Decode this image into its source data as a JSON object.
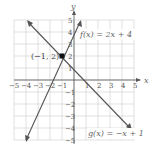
{
  "chart_data": {
    "type": "line",
    "title": "",
    "xlabel": "x",
    "ylabel": "y",
    "xlim": [
      -5,
      5
    ],
    "ylim": [
      -5,
      5
    ],
    "grid": true,
    "x_ticks": [
      "−5",
      "−4",
      "−3",
      "−2",
      "−1",
      "1",
      "2",
      "3",
      "4",
      "5"
    ],
    "y_ticks": [
      "5",
      "4",
      "3",
      "2",
      "1",
      "−1",
      "−2",
      "−3",
      "−4",
      "−5"
    ],
    "series": [
      {
        "name": "f(x) = 2x + 4",
        "slope": 2,
        "intercept": 4,
        "x": [
          -4.5,
          0.5
        ],
        "y": [
          -5,
          5
        ]
      },
      {
        "name": "g(x) = −x + 1",
        "slope": -1,
        "intercept": 1,
        "x": [
          -4,
          5
        ],
        "y": [
          5,
          -4
        ]
      }
    ],
    "annotations": [
      {
        "text": "(−1, 2)",
        "x": -1,
        "y": 2,
        "type": "intersection-point"
      }
    ],
    "labels": {
      "f": "f(x) = 2x + 4",
      "g": "g(x) = −x + 1",
      "point": "(−1, 2)",
      "x_axis": "x",
      "y_axis": "y"
    }
  }
}
